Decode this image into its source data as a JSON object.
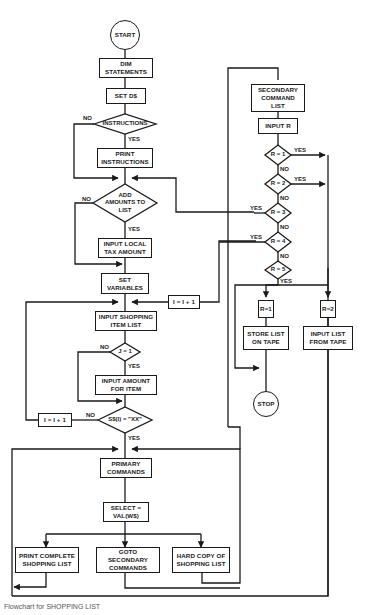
{
  "diagram": {
    "type": "flowchart",
    "title": "SHOPPING LIST",
    "caption": "Flowchart for SHOPPING LIST",
    "nodes": {
      "start": "START",
      "dim": "DIM\nSTATEMENTS",
      "setd": "SET D$",
      "instructions": "INSTRUCTIONS",
      "print_instr": "PRINT\nINSTRUCTIONS",
      "add_amounts": "ADD\nAMOUNTS TO\nLIST",
      "input_tax": "INPUT LOCAL\nTAX AMOUNT",
      "set_vars": "SET\nVARIABLES",
      "input_items": "INPUT SHOPPING\nITEM LIST",
      "j_eq_1": "J = 1",
      "input_amount": "INPUT AMOUNT\nFOR ITEM",
      "s_check": "S$(I) = \"XX\"",
      "incr_left": "I = I + 1",
      "incr_right": "I = I + 1",
      "primary": "PRIMARY\nCOMMANDS",
      "select": "SELECT =\nVAL(W$)",
      "print_list": "PRINT COMPLETE\nSHOPPING LIST",
      "goto_secondary": "GOTO\nSECONDARY\nCOMMANDS",
      "hard_copy": "HARD COPY OF\nSHOPPING LIST",
      "secondary": "SECONDARY\nCOMMAND\nLIST",
      "input_r": "INPUT R",
      "r1": "R = 1",
      "r2": "R = 2",
      "r3": "R = 3",
      "r4": "R = 4",
      "r5": "R = 5",
      "r1_box": "R=1",
      "r2_box": "R=2",
      "store": "STORE LIST\nON TAPE",
      "input_tape": "INPUT LIST\nFROM TAPE",
      "stop": "STOP"
    },
    "labels": {
      "yes": "YES",
      "no": "NO"
    },
    "line_color": "#1a1a1a"
  }
}
